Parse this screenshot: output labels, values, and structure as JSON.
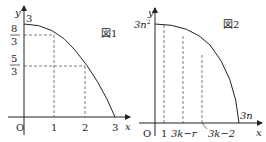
{
  "figure1": {
    "caption": "図1",
    "axis_x": "x",
    "axis_y": "y",
    "origin": "O",
    "x_ticks": [
      "1",
      "2",
      "3"
    ],
    "y_top": "3",
    "y_frac1_num": "8",
    "y_frac1_den": "3",
    "y_frac2_num": "5",
    "y_frac2_den": "3"
  },
  "figure2": {
    "caption": "図2",
    "axis_x": "x",
    "axis_y": "y",
    "origin": "O",
    "y_top": "3n",
    "y_top_sup": "2",
    "x_tick1": "1",
    "x_tick2": "3k−r",
    "x_tick3": "3k−2",
    "x_end": "3n"
  }
}
